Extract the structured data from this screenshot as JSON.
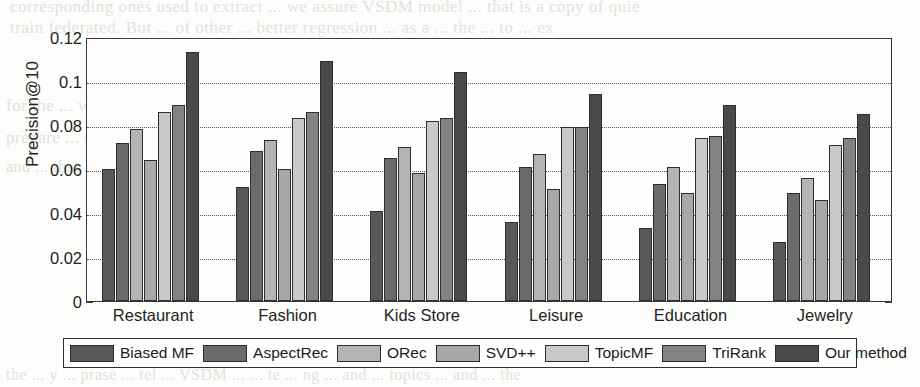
{
  "chart_data": {
    "type": "bar",
    "title": "",
    "xlabel": "",
    "ylabel": "Precision@10",
    "ylim": [
      0,
      0.12
    ],
    "yticks": [
      0,
      0.02,
      0.04,
      0.06,
      0.08,
      0.1,
      0.12
    ],
    "ytick_labels": [
      "0",
      "0.02",
      "0.04",
      "0.06",
      "0.08",
      "0.1",
      "0.12"
    ],
    "grid": "horizontal-dotted",
    "legend_position": "below-axes",
    "categories": [
      "Restaurant",
      "Fashion",
      "Kids Store",
      "Leisure",
      "Education",
      "Jewelry"
    ],
    "series": [
      {
        "name": "Biased MF",
        "color": "#595959",
        "values": [
          0.06,
          0.052,
          0.041,
          0.036,
          0.033,
          0.027
        ]
      },
      {
        "name": "AspectRec",
        "color": "#6b6b6b",
        "values": [
          0.072,
          0.068,
          0.065,
          0.061,
          0.053,
          0.049
        ]
      },
      {
        "name": "ORec",
        "color": "#b4b4b4",
        "values": [
          0.078,
          0.073,
          0.07,
          0.067,
          0.061,
          0.056
        ]
      },
      {
        "name": "SVD++",
        "color": "#a8a8a8",
        "values": [
          0.064,
          0.06,
          0.058,
          0.051,
          0.049,
          0.046
        ]
      },
      {
        "name": "TopicMF",
        "color": "#c9c9c9",
        "values": [
          0.086,
          0.083,
          0.082,
          0.079,
          0.074,
          0.071
        ]
      },
      {
        "name": "TriRank",
        "color": "#828282",
        "values": [
          0.089,
          0.086,
          0.083,
          0.079,
          0.075,
          0.074
        ]
      },
      {
        "name": "Our method",
        "color": "#4a4a4a",
        "values": [
          0.113,
          0.109,
          0.104,
          0.094,
          0.089,
          0.085
        ]
      }
    ]
  },
  "legend": {
    "items": [
      {
        "label": "Biased MF"
      },
      {
        "label": "AspectRec"
      },
      {
        "label": "ORec"
      },
      {
        "label": "SVD++"
      },
      {
        "label": "TopicMF"
      },
      {
        "label": "TriRank"
      },
      {
        "label": "Our method"
      }
    ]
  },
  "background_text": {
    "top_1": "corresponding ones used to extract  ... we assure VSDM model  ... that is a copy of quie",
    "top_2": "train federated. But  ... of other  ... better regression  ... as a  ... the  ... to  ... ex",
    "mid_1": "for the  ... with  ... the  ... there  ...  se  ... and  ... ev  ... a.y  ... as",
    "mid_2": "prepare  ... dis  ... jons  ... a u  ...  ... er  ... essed  ...  presence  ... proi  ... an",
    "mid_3": "and  ... that  ... the  ... pe  ...  ...  stat  ...  ...  ...  ...  ...",
    "bot_1": "the  ... y  ...  prase  ... tel  ... VSDM  ...  ... te  ... ng  ... and  ... topics  ... and  ... the"
  }
}
